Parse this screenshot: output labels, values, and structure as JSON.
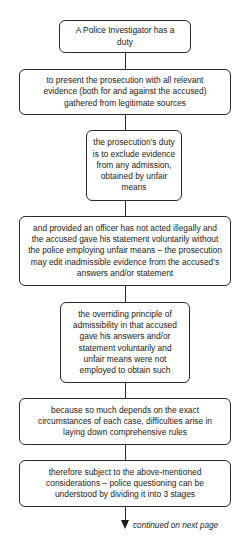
{
  "diagram": {
    "type": "vertical-flowchart",
    "nodes": [
      {
        "id": "n1",
        "text": "A Police Investigator has a duty"
      },
      {
        "id": "n2",
        "text": "to present the prosecution with all relevant evidence (both for and against the accused) gathered from legitimate sources"
      },
      {
        "id": "n3",
        "text": "the prosecution’s duty is to exclude evidence from any admission, obtained by unfair means"
      },
      {
        "id": "n4",
        "text": "and provided an officer has not acted illegally and the accused gave his statement voluntarily without the police employing unfair means – the prosecution may edit inadmissible evidence from the accused’s answers and/or statement"
      },
      {
        "id": "n5",
        "text": "the overriding principle of admissibility in that accused gave his answers and/or statement voluntarily and unfair means were not employed to obtain such"
      },
      {
        "id": "n6",
        "text": "because so much depends on the exact circumstances of each case, difficulties arise in laying down comprehensive rules"
      },
      {
        "id": "n7",
        "text": "therefore subject to the above-mentioned considerations – police questioning can be understood by dividing it into 3 stages"
      }
    ],
    "edges": [
      {
        "from": "n1",
        "to": "n2"
      },
      {
        "from": "n2",
        "to": "n3"
      },
      {
        "from": "n3",
        "to": "n4"
      },
      {
        "from": "n4",
        "to": "n5"
      },
      {
        "from": "n5",
        "to": "n6"
      },
      {
        "from": "n6",
        "to": "n7"
      }
    ],
    "continuation_label": "continued on next page"
  }
}
